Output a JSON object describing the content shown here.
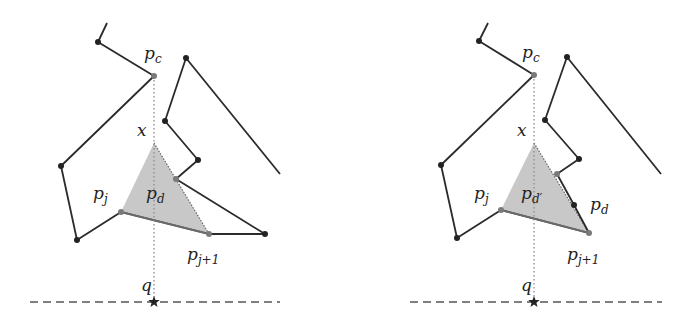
{
  "figure": {
    "panels": [
      {
        "id": "left",
        "polyline_main": [
          [
            107,
            23
          ],
          [
            98,
            42
          ],
          [
            154,
            76
          ],
          [
            61,
            166
          ],
          [
            77,
            240
          ],
          [
            121,
            212
          ],
          [
            209,
            234
          ],
          [
            265,
            234
          ],
          [
            176,
            179
          ],
          [
            198,
            160
          ],
          [
            165,
            121
          ],
          [
            186,
            58
          ],
          [
            280,
            174
          ]
        ],
        "vertices_dark": [
          [
            98,
            42
          ],
          [
            61,
            166
          ],
          [
            77,
            240
          ],
          [
            265,
            234
          ],
          [
            198,
            160
          ],
          [
            165,
            121
          ],
          [
            186,
            58
          ]
        ],
        "vertices_gray": [
          [
            154,
            76
          ],
          [
            121,
            212
          ],
          [
            209,
            234
          ],
          [
            176,
            179
          ]
        ],
        "triangle": [
          [
            154,
            143
          ],
          [
            121,
            212
          ],
          [
            209,
            234
          ]
        ],
        "vertical_x": 154,
        "vertical_top": 76,
        "vertical_bottom": 302,
        "baseline": {
          "y": 302,
          "x1": 30,
          "x2": 280
        },
        "labels": {
          "pc": {
            "text": "p",
            "sub": "c",
            "x": 144,
            "y": 59
          },
          "x": {
            "text": "x",
            "x": 137,
            "y": 136
          },
          "pj": {
            "text": "p",
            "sub": "j",
            "x": 93,
            "y": 199
          },
          "pd": {
            "text": "p",
            "sub": "d",
            "x": 146,
            "y": 199
          },
          "pj1": {
            "text": "p",
            "sub": "j+1",
            "x": 187,
            "y": 260
          },
          "q": {
            "text": "q",
            "x": 141,
            "y": 291
          }
        }
      },
      {
        "id": "right",
        "polyline_main": [
          [
            488,
            23
          ],
          [
            479,
            41
          ],
          [
            534,
            75
          ],
          [
            441,
            165
          ],
          [
            457,
            238
          ],
          [
            501,
            210
          ],
          [
            589,
            233
          ],
          [
            574,
            205
          ],
          [
            557,
            174
          ],
          [
            579,
            159
          ],
          [
            545,
            120
          ],
          [
            567,
            57
          ],
          [
            661,
            174
          ]
        ],
        "vertices_dark": [
          [
            479,
            41
          ],
          [
            441,
            165
          ],
          [
            457,
            238
          ],
          [
            574,
            205
          ],
          [
            579,
            159
          ],
          [
            545,
            120
          ],
          [
            567,
            57
          ]
        ],
        "vertices_gray": [
          [
            534,
            75
          ],
          [
            501,
            210
          ],
          [
            589,
            233
          ],
          [
            557,
            174
          ]
        ],
        "triangle": [
          [
            534,
            143
          ],
          [
            501,
            210
          ],
          [
            589,
            233
          ]
        ],
        "vertical_x": 534,
        "vertical_top": 75,
        "vertical_bottom": 302,
        "baseline": {
          "y": 302,
          "x1": 410,
          "x2": 662
        },
        "labels": {
          "pc": {
            "text": "p",
            "sub": "c",
            "x": 522,
            "y": 58
          },
          "x": {
            "text": "x",
            "x": 517,
            "y": 136
          },
          "pj": {
            "text": "p",
            "sub": "j",
            "x": 474,
            "y": 199
          },
          "pd_prime": {
            "text": "p",
            "sub": "d′",
            "x": 521,
            "y": 199
          },
          "pd": {
            "text": "p",
            "sub": "d",
            "x": 590,
            "y": 210
          },
          "pj1": {
            "text": "p",
            "sub": "j+1",
            "x": 567,
            "y": 260
          },
          "q": {
            "text": "q",
            "x": 521,
            "y": 291
          }
        }
      }
    ],
    "colors": {
      "line": "#2b2b2b",
      "vertex_dark": "#222222",
      "vertex_gray": "#7a7a7a",
      "triangle_fill": "#c8c8c8",
      "triangle_edge": "#666666",
      "dotted": "#888888",
      "dashed": "#555555"
    }
  }
}
